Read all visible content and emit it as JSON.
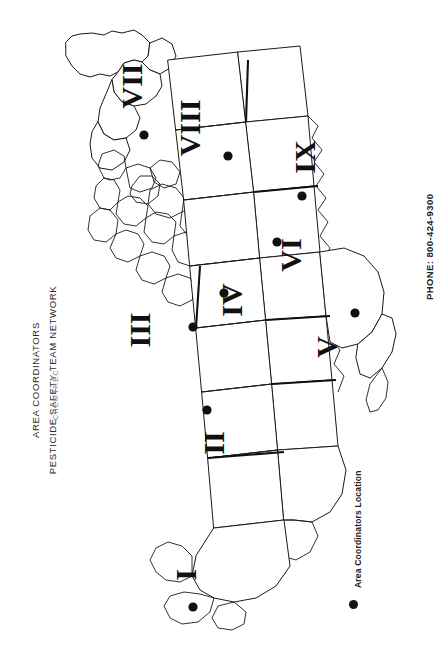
{
  "document": {
    "title_line_1": "AREA COORDINATORS",
    "title_line_2": "PESTICIDE SAFETY TEAM NETWORK",
    "subtitle": "CHEMTREC",
    "phone_label": "PHONE: 800-424-9300"
  },
  "legend": {
    "marker_icon": "filled-circle-icon",
    "label": "Area Coordinators Location",
    "marker_color": "#151515"
  },
  "map": {
    "orientation": "rotated-90-counterclockwise",
    "projection_note": "contiguous united states outline",
    "outline_color": "#1a1a1a",
    "fill_color": "#ffffff",
    "regions": [
      {
        "id": "region-1",
        "numeral": "I",
        "label_x": 196,
        "label_y": 575,
        "rotation": -90,
        "dot_x": 193,
        "dot_y": 607
      },
      {
        "id": "region-2",
        "numeral": "II",
        "label_x": 224,
        "label_y": 443,
        "rotation": -90,
        "dot_x": 207,
        "dot_y": 410
      },
      {
        "id": "region-3",
        "numeral": "III",
        "label_x": 150,
        "label_y": 330,
        "rotation": -90,
        "dot_x": 193,
        "dot_y": 327
      },
      {
        "id": "region-4",
        "numeral": "IV",
        "label_x": 242,
        "label_y": 300,
        "rotation": -90,
        "dot_x": 224,
        "dot_y": 293
      },
      {
        "id": "region-5",
        "numeral": "V",
        "label_x": 337,
        "label_y": 347,
        "rotation": -90,
        "dot_x": 355,
        "dot_y": 313
      },
      {
        "id": "region-6",
        "numeral": "VI",
        "label_x": 301,
        "label_y": 255,
        "rotation": -90,
        "dot_x": 277,
        "dot_y": 242
      },
      {
        "id": "region-7",
        "numeral": "VII",
        "label_x": 142,
        "label_y": 86,
        "rotation": -90,
        "dot_x": 144,
        "dot_y": 135
      },
      {
        "id": "region-8",
        "numeral": "VIII",
        "label_x": 200,
        "label_y": 128,
        "rotation": -90,
        "dot_x": 228,
        "dot_y": 156
      },
      {
        "id": "region-9",
        "numeral": "IX",
        "label_x": 315,
        "label_y": 157,
        "rotation": -90,
        "dot_x": 302,
        "dot_y": 196
      }
    ]
  }
}
